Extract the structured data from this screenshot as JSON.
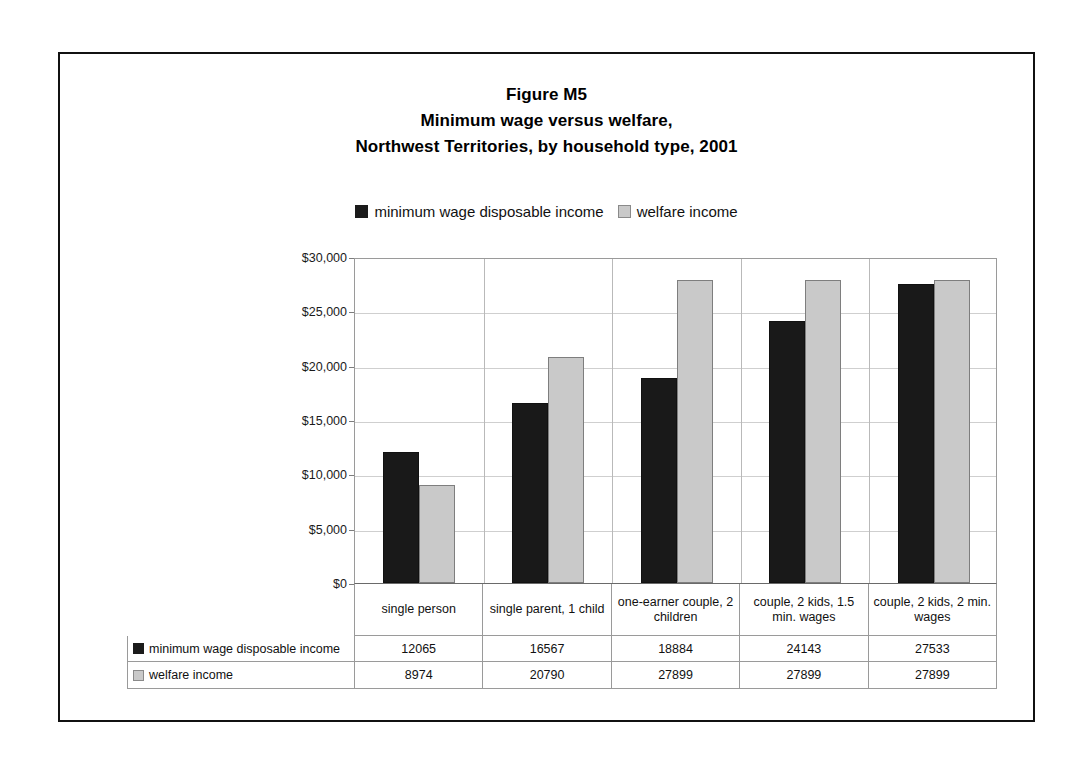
{
  "figure": {
    "title_lines": [
      "Figure M5",
      "Minimum wage versus welfare,",
      "Northwest Territories, by household type, 2001"
    ]
  },
  "legend": {
    "entries": [
      {
        "label": "minimum wage disposable income",
        "swatch": "dark-square-icon",
        "color": "#191919"
      },
      {
        "label": "welfare income",
        "swatch": "light-square-icon",
        "color": "#c9c9c9"
      }
    ]
  },
  "axis": {
    "y_ticks": [
      "$30,000",
      "$25,000",
      "$20,000",
      "$15,000",
      "$10,000",
      "$5,000",
      "$0"
    ]
  },
  "table": {
    "row_labels": [
      "minimum wage disposable income",
      "welfare income"
    ],
    "rows": [
      [
        "12065",
        "16567",
        "18884",
        "24143",
        "27533"
      ],
      [
        "8974",
        "20790",
        "27899",
        "27899",
        "27899"
      ]
    ]
  },
  "chart_data": {
    "type": "bar",
    "xlabel": "",
    "ylabel": "",
    "ylim": [
      0,
      30000
    ],
    "ytick_values": [
      0,
      5000,
      10000,
      15000,
      20000,
      25000,
      30000
    ],
    "ytick_labels": [
      "$0",
      "$5,000",
      "$10,000",
      "$15,000",
      "$20,000",
      "$25,000",
      "$30,000"
    ],
    "grid": true,
    "legend_position": "top-center",
    "categories": [
      "single person",
      "single parent, 1 child",
      "one-earner couple, 2 children",
      "couple, 2 kids, 1.5 min. wages",
      "couple, 2 kids, 2 min. wages"
    ],
    "series": [
      {
        "name": "minimum wage disposable income",
        "color": "#191919",
        "values": [
          12065,
          16567,
          18884,
          24143,
          27533
        ]
      },
      {
        "name": "welfare income",
        "color": "#c9c9c9",
        "values": [
          8974,
          20790,
          27899,
          27899,
          27899
        ]
      }
    ]
  }
}
